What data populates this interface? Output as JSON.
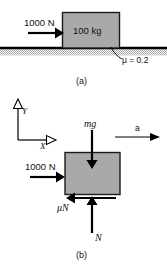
{
  "figure": {
    "background_color": "#ffffff",
    "block_fill_color": "#a9a9a9",
    "block_stroke_color": "#1a1a1a",
    "arrow_color": "#000000",
    "ground_hatch_color": "#b4b4b4"
  },
  "panel_a": {
    "caption": "(a)",
    "applied_force_label": "1000 N",
    "block_label": "100 kg",
    "friction_label": "μ = 0.2"
  },
  "panel_b": {
    "caption": "(b)",
    "applied_force_label": "1000 N",
    "weight_label": "mg",
    "friction_force_label": "μN",
    "normal_force_label": "N",
    "acceleration_label": "a",
    "axis_x_label": "X",
    "axis_y_label": "Y"
  }
}
